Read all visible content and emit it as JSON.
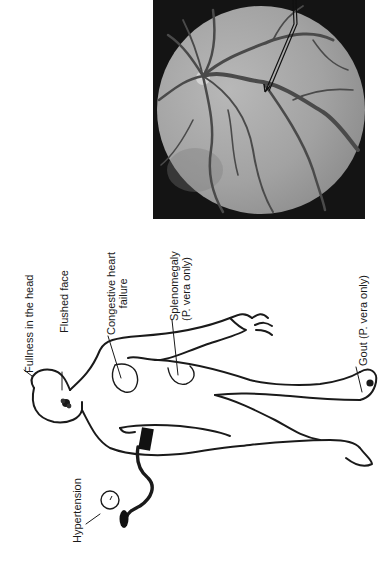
{
  "figure": {
    "orientation": "rotated -90deg (text reads bottom-to-top)",
    "photo": {
      "subject": "retinal fundus photograph",
      "annotation": "arrow pointing to engorged retinal vein"
    },
    "diagram": {
      "subject": "human body outline with blood pressure cuff and sphygmomanometer"
    },
    "labels": {
      "fullness_head": "Fullness in the head",
      "flushed_face": "Flushed face",
      "chf_line1": "Congestive heart",
      "chf_line2": "failure",
      "spleno_line1": "Splenomegaly",
      "spleno_line2": "(P. vera only)",
      "gout": "Gout (P. vera only)",
      "hypertension": "Hypertension"
    },
    "colors": {
      "line": "#1a1a1a",
      "photo_bg": "#141414",
      "fundus": "#9a9a9a",
      "vessel": "#4a4a4a"
    }
  }
}
